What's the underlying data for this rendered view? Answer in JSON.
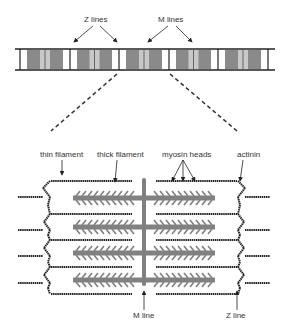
{
  "diagram": {
    "top_labels": {
      "z_lines": "Z lines",
      "m_lines": "M lines"
    },
    "detail_labels": {
      "thin_filament": "thin filament",
      "thick_filament": "thick filament",
      "myosin_heads": "myosin heads",
      "actinin": "actinin",
      "m_line": "M line",
      "z_line": "Z line"
    },
    "colors": {
      "line": "#222222",
      "thick_filament": "#808080",
      "a_band": "#8a8a8a",
      "h_zone": "#c8c8c8",
      "background": "#ffffff"
    }
  }
}
